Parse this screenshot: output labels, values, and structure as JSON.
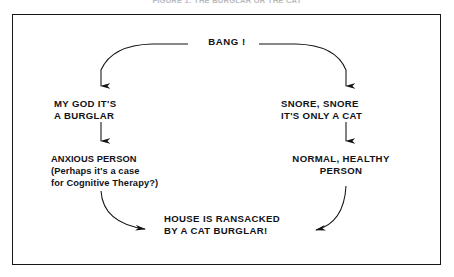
{
  "caption": {
    "text": "FIGURE 1: THE BURGLAR OR THE CAT"
  },
  "diagram": {
    "type": "flowchart",
    "title": "BANG !",
    "nodes": [
      {
        "id": "bang",
        "lines": [
          "BANG !"
        ]
      },
      {
        "id": "burglar",
        "lines": [
          "MY GOD IT'S",
          "A BURGLAR"
        ]
      },
      {
        "id": "cat",
        "lines": [
          "SNORE, SNORE",
          "IT'S ONLY A CAT"
        ]
      },
      {
        "id": "anxious",
        "lines": [
          "ANXIOUS PERSON",
          "(Perhaps it's a case",
          "for Cognitive Therapy?)"
        ]
      },
      {
        "id": "normal",
        "lines": [
          "NORMAL, HEALTHY",
          "PERSON"
        ]
      },
      {
        "id": "ransacked",
        "lines": [
          "HOUSE IS RANSACKED",
          "BY  A CAT BURGLAR!"
        ]
      }
    ],
    "edges": [
      {
        "from": "bang",
        "to": "burglar",
        "style": "curve-left"
      },
      {
        "from": "bang",
        "to": "cat",
        "style": "curve-right"
      },
      {
        "from": "burglar",
        "to": "anxious",
        "style": "vertical"
      },
      {
        "from": "cat",
        "to": "normal",
        "style": "vertical"
      },
      {
        "from": "anxious",
        "to": "ransacked",
        "style": "curve-down-right"
      },
      {
        "from": "normal",
        "to": "ransacked",
        "style": "curve-down-left"
      }
    ],
    "colors": {
      "ink": "#121217",
      "border": "#15151a",
      "background": "#ffffff",
      "caption": "#b9b9bd"
    }
  }
}
